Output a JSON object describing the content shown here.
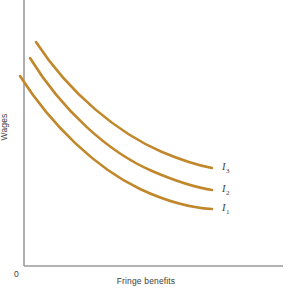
{
  "figure": {
    "background_color": "#ffffff",
    "width": 292,
    "height": 296
  },
  "axes": {
    "origin_label": "0",
    "axis_color": "#9a9a9a",
    "x_label": "Fringe benefits",
    "y_label": "Wages",
    "x_axis_pixel_y": 266,
    "y_axis_pixel_x": 24,
    "x_axis_end_pixel_x": 283,
    "y_axis_top_pixel_y": 0
  },
  "curves": [
    {
      "id": "I1",
      "label_base": "I",
      "label_sub": "1",
      "color": "#C0872B",
      "label_left": 222,
      "label_top": 203,
      "path": "M 20 76 C 52 126, 96 168, 140 189 C 172 204, 195 208, 212 209"
    },
    {
      "id": "I2",
      "label_base": "I",
      "label_sub": "2",
      "color": "#C0872B",
      "label_left": 222,
      "label_top": 184,
      "path": "M 30 58 C 62 110, 108 152, 152 171 C 180 183, 199 188, 212 190"
    },
    {
      "id": "I3",
      "label_base": "I",
      "label_sub": "3",
      "color": "#C0872B",
      "label_left": 222,
      "label_top": 162,
      "path": "M 36 42 C 70 94, 118 133, 162 152 C 186 162, 201 166, 212 168"
    }
  ],
  "chart_data": {
    "type": "line",
    "title": "",
    "subtitle": "",
    "xlabel": "Fringe benefits",
    "ylabel": "Wages",
    "xlim": [
      0,
      1
    ],
    "ylim": [
      0,
      1
    ],
    "grid": false,
    "legend": "inline-right-end-labels",
    "axis_ticks": {
      "x": [],
      "y": []
    },
    "annotations": [
      "0"
    ],
    "series": [
      {
        "name": "I1",
        "display_label": "I₁",
        "color": "#C0872B",
        "description": "Lowest indifference curve, convex to the origin",
        "x": [
          0.0,
          0.12,
          0.25,
          0.38,
          0.5,
          0.63,
          0.75,
          0.88,
          1.0
        ],
        "y": [
          0.72,
          0.56,
          0.44,
          0.36,
          0.31,
          0.27,
          0.24,
          0.23,
          0.22
        ]
      },
      {
        "name": "I2",
        "display_label": "I₂",
        "color": "#C0872B",
        "description": "Middle indifference curve, higher utility than I1",
        "x": [
          0.0,
          0.12,
          0.25,
          0.38,
          0.5,
          0.63,
          0.75,
          0.88,
          1.0
        ],
        "y": [
          0.79,
          0.63,
          0.51,
          0.43,
          0.38,
          0.34,
          0.32,
          0.31,
          0.3
        ]
      },
      {
        "name": "I3",
        "display_label": "I₃",
        "color": "#C0872B",
        "description": "Highest indifference curve, highest utility",
        "x": [
          0.0,
          0.12,
          0.25,
          0.38,
          0.5,
          0.63,
          0.75,
          0.88,
          1.0
        ],
        "y": [
          0.85,
          0.71,
          0.59,
          0.51,
          0.46,
          0.42,
          0.4,
          0.38,
          0.37
        ]
      }
    ]
  }
}
